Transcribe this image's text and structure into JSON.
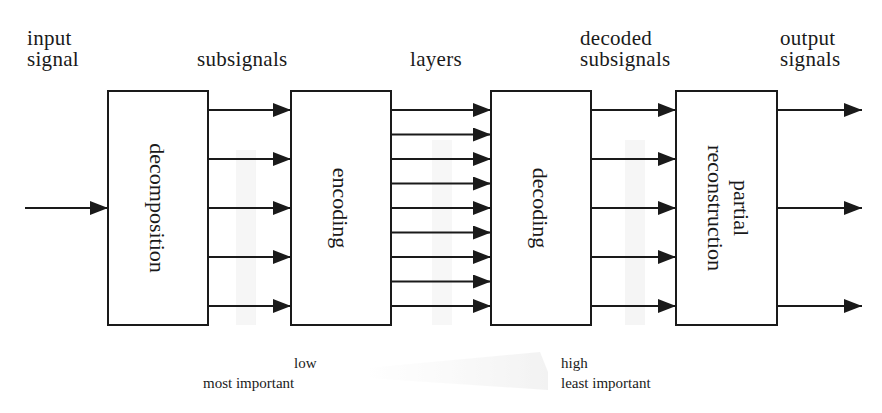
{
  "diagram": {
    "type": "block-diagram",
    "direction": "left-to-right",
    "top_labels": {
      "input": "input\nsignal",
      "subsignals": "subsignals",
      "layers": "layers",
      "decoded": "decoded\nsubsignals",
      "output": "output\nsignals"
    },
    "blocks": [
      {
        "id": "decomposition",
        "label": "decomposition"
      },
      {
        "id": "encoding",
        "label": "encoding"
      },
      {
        "id": "decoding",
        "label": "decoding"
      },
      {
        "id": "reconstruction",
        "label_line1": "partial",
        "label_line2": "reconstruction"
      }
    ],
    "connections": {
      "input_to_decomposition": 1,
      "decomposition_to_encoding": 5,
      "encoding_to_decoding": 9,
      "decoding_to_reconstruction": 5,
      "reconstruction_outputs": 3
    },
    "bottom_legend": {
      "left_line1": "low",
      "left_line2": "most important",
      "right_line1": "high",
      "right_line2": "least important"
    },
    "colors": {
      "stroke": "#1a1a1a",
      "background": "#ffffff"
    }
  }
}
